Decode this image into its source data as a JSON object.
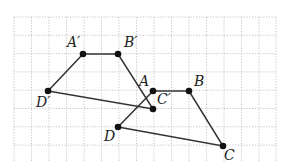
{
  "figure": {
    "grid": {
      "x_lines": [
        14,
        31.5,
        49,
        66.5,
        84,
        101.5,
        119,
        136.5,
        154,
        171.5,
        189,
        206.5,
        224,
        241.5,
        259,
        276
      ],
      "y_lines": [
        17,
        35.3,
        53.6,
        71.9,
        90.2,
        108.5,
        126.8,
        145.1
      ],
      "x_min": 14,
      "x_max": 276,
      "y_min": 17,
      "y_max": 162
    },
    "points": {
      "A": {
        "label": "A",
        "x": 153,
        "y": 91,
        "lx": 139,
        "ly": 86
      },
      "B": {
        "label": "B",
        "x": 189,
        "y": 91,
        "lx": 194,
        "ly": 86
      },
      "C": {
        "label": "C",
        "x": 223,
        "y": 146,
        "lx": 224,
        "ly": 160
      },
      "D": {
        "label": "D",
        "x": 118,
        "y": 127,
        "lx": 104,
        "ly": 141
      },
      "A'": {
        "label": "A′",
        "x": 83,
        "y": 54,
        "lx": 67,
        "ly": 47
      },
      "B'": {
        "label": "B′",
        "x": 118,
        "y": 54,
        "lx": 124,
        "ly": 47
      },
      "C'": {
        "label": "C′",
        "x": 153,
        "y": 109,
        "lx": 157,
        "ly": 104
      },
      "D'": {
        "label": "D′",
        "x": 48,
        "y": 91,
        "lx": 36,
        "ly": 107
      }
    },
    "polygons": [
      {
        "name": "ABCD",
        "vertices": [
          "A",
          "B",
          "C",
          "D"
        ]
      },
      {
        "name": "A'B'C'D'",
        "vertices": [
          "A'",
          "B'",
          "C'",
          "D'"
        ]
      }
    ],
    "colors": {
      "edge": "#333333",
      "point": "#111111",
      "grid": "#b8b8b8"
    }
  }
}
